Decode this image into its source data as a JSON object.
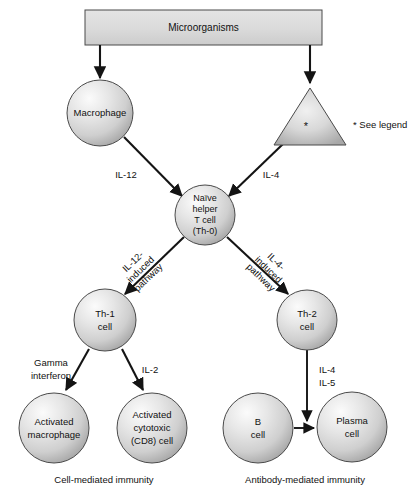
{
  "figure": {
    "title_box": {
      "label": "Microorganisms"
    },
    "legend": {
      "marker": "*",
      "text": "* See legend",
      "triangle_mark": "*"
    },
    "captions": {
      "left": "Cell-mediated immunity",
      "right": "Antibody-mediated immunity"
    }
  },
  "nodes": {
    "macrophage": {
      "label": "Macrophage",
      "cx": 100,
      "cy": 113,
      "r": 33
    },
    "apc_triangle": {
      "label": "*",
      "apex_x": 310,
      "apex_y": 88,
      "left_x": 274,
      "right_x": 346,
      "base_y": 145
    },
    "naive_t": {
      "line1": "Naïve",
      "line2": "helper",
      "line3": "T cell",
      "line4": "(Th-0)",
      "cx": 205,
      "cy": 215,
      "r": 30
    },
    "th1": {
      "line1": "Th-1",
      "line2": "cell",
      "cx": 105,
      "cy": 320,
      "r": 31
    },
    "th2": {
      "line1": "Th-2",
      "line2": "cell",
      "cx": 307,
      "cy": 320,
      "r": 30
    },
    "activated_macrophage": {
      "line1": "Activated",
      "line2": "macrophage",
      "cx": 54,
      "cy": 428,
      "r": 35
    },
    "activated_cytotoxic": {
      "line1": "Activated",
      "line2": "cytotoxic",
      "line3": "(CD8) cell",
      "cx": 152,
      "cy": 428,
      "r": 35
    },
    "b_cell": {
      "line1": "B",
      "line2": "cell",
      "cx": 258,
      "cy": 428,
      "r": 35
    },
    "plasma_cell": {
      "line1": "Plasma",
      "line2": "cell",
      "cx": 352,
      "cy": 427,
      "r": 35
    }
  },
  "edges": {
    "micro_to_macrophage": {
      "label": ""
    },
    "micro_to_apc": {
      "label": ""
    },
    "macrophage_to_naive": {
      "label": "IL-12",
      "x": 126,
      "y": 175
    },
    "apc_to_naive": {
      "label": "IL-4",
      "x": 271,
      "y": 175
    },
    "naive_to_th1": {
      "l1": "IL-12-",
      "l2": "induced",
      "l3": "pathway",
      "rotate": -44
    },
    "naive_to_th2": {
      "l1": "IL-4-",
      "l2": "induced",
      "l3": "pathway",
      "rotate": 44
    },
    "th1_to_activated_macrophage": {
      "l1": "Gamma",
      "l2": "interferon",
      "x": 51,
      "y": 363
    },
    "th1_to_cytotoxic": {
      "label": "IL-2",
      "x": 148,
      "y": 372
    },
    "th2_to_plasma": {
      "l1": "IL-4",
      "l2": "IL-5",
      "x": 325,
      "y": 372
    },
    "b_to_plasma": {
      "label": ""
    }
  },
  "colors": {
    "sphere_light": "#f2f2f2",
    "sphere_mid": "#d2d2d2",
    "sphere_dark": "#9a9a9a",
    "outline": "#4a4a4a",
    "line": "#141414",
    "box_fill": "#dcdcdc",
    "text": "#111111",
    "background": "#ffffff"
  }
}
